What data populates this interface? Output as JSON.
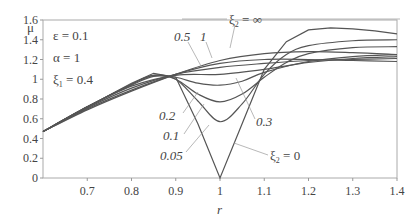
{
  "chart_data": {
    "type": "line",
    "title": "",
    "xlabel": "r",
    "ylabel": "μ",
    "xlim": [
      0.6,
      1.4
    ],
    "ylim": [
      0,
      1.6
    ],
    "xticks": [
      "0.7",
      "0.8",
      "0.9",
      "1",
      "1.1",
      "1.2",
      "1.3",
      "1.4"
    ],
    "yticks": [
      "0",
      "0.2",
      "0.4",
      "0.6",
      "0.8",
      "1",
      "1.2",
      "1.4",
      "1.6"
    ],
    "grid": false,
    "parameters": [
      "ε = 0.1",
      "α = 1",
      "ξ₁ = 0.4"
    ],
    "series": [
      {
        "name": "ξ₂ = 0",
        "label": "ξ₂ = 0",
        "x": [
          0.6,
          0.7,
          0.8,
          0.85,
          0.9,
          0.95,
          1.0,
          1.05,
          1.1,
          1.15,
          1.2,
          1.25,
          1.3,
          1.35,
          1.4
        ],
        "y": [
          0.47,
          0.72,
          0.96,
          1.06,
          1.02,
          0.55,
          0.0,
          0.55,
          1.1,
          1.38,
          1.5,
          1.52,
          1.51,
          1.49,
          1.46
        ]
      },
      {
        "name": "ξ₂ = 0.05",
        "label": "0.05",
        "x": [
          0.6,
          0.7,
          0.8,
          0.85,
          0.9,
          0.95,
          1.0,
          1.05,
          1.1,
          1.15,
          1.2,
          1.3,
          1.4
        ],
        "y": [
          0.47,
          0.72,
          0.95,
          1.04,
          1.0,
          0.78,
          0.57,
          0.75,
          1.05,
          1.25,
          1.34,
          1.39,
          1.4
        ]
      },
      {
        "name": "ξ₂ = 0.1",
        "label": "0.1",
        "x": [
          0.6,
          0.7,
          0.8,
          0.85,
          0.9,
          0.95,
          1.0,
          1.05,
          1.1,
          1.15,
          1.2,
          1.3,
          1.4
        ],
        "y": [
          0.47,
          0.72,
          0.95,
          1.04,
          1.0,
          0.85,
          0.77,
          0.85,
          1.02,
          1.17,
          1.26,
          1.32,
          1.33
        ]
      },
      {
        "name": "ξ₂ = 0.2",
        "label": "0.2",
        "x": [
          0.6,
          0.7,
          0.8,
          0.85,
          0.9,
          0.95,
          1.0,
          1.05,
          1.1,
          1.2,
          1.3,
          1.4
        ],
        "y": [
          0.47,
          0.72,
          0.94,
          1.03,
          1.02,
          0.96,
          0.94,
          0.98,
          1.07,
          1.18,
          1.23,
          1.25
        ]
      },
      {
        "name": "ξ₂ = 0.3",
        "label": "0.3",
        "x": [
          0.6,
          0.7,
          0.8,
          0.9,
          1.0,
          1.1,
          1.2,
          1.3,
          1.4
        ],
        "y": [
          0.47,
          0.72,
          0.93,
          1.04,
          1.05,
          1.1,
          1.17,
          1.21,
          1.23
        ]
      },
      {
        "name": "ξ₂ = 0.5",
        "label": "0.5",
        "x": [
          0.6,
          0.7,
          0.8,
          0.9,
          1.0,
          1.1,
          1.2,
          1.3,
          1.4
        ],
        "y": [
          0.47,
          0.71,
          0.91,
          1.05,
          1.12,
          1.16,
          1.19,
          1.2,
          1.21
        ]
      },
      {
        "name": "ξ₂ = 1",
        "label": "1",
        "x": [
          0.6,
          0.7,
          0.8,
          0.9,
          1.0,
          1.1,
          1.2,
          1.3,
          1.4
        ],
        "y": [
          0.47,
          0.7,
          0.89,
          1.05,
          1.16,
          1.2,
          1.2,
          1.19,
          1.18
        ]
      },
      {
        "name": "ξ₂ = ∞",
        "label": "ξ₂ = ∞",
        "x": [
          0.6,
          0.7,
          0.8,
          0.9,
          1.0,
          1.1,
          1.2,
          1.3,
          1.4
        ],
        "y": [
          0.47,
          0.69,
          0.88,
          1.05,
          1.19,
          1.26,
          1.28,
          1.27,
          1.25
        ]
      }
    ],
    "annotations": [
      "ξ₂ = ∞",
      "0.5",
      "1",
      "0.2",
      "0.1",
      "0.05",
      "0.3",
      "ξ₂ = 0"
    ]
  },
  "labels": {
    "ylabel": "μ",
    "xlabel": "r",
    "param_eps": "ε = 0.1",
    "param_alpha": "α = 1",
    "param_xi1_base": "ξ",
    "param_xi1_sub": "1",
    "param_xi1_val": " = 0.4",
    "ann_inf_base": "ξ",
    "ann_inf_sub": "2",
    "ann_inf_val": " = ∞",
    "ann_zero_base": "ξ",
    "ann_zero_sub": "2",
    "ann_zero_val": " = 0",
    "ann_05": "0.5",
    "ann_1": "1",
    "ann_02": "0.2",
    "ann_01": "0.1",
    "ann_005": "0.05",
    "ann_03": "0.3"
  },
  "colors": {
    "line": "#555555",
    "axis": "#999999",
    "text": "#444444"
  }
}
